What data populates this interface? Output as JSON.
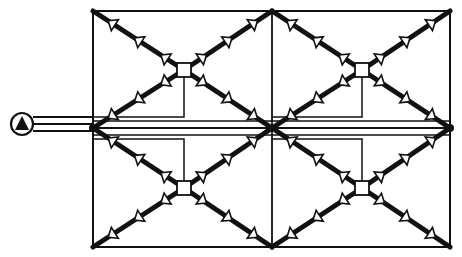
{
  "diagram": {
    "type": "piping-schematic",
    "colors": {
      "line": "#111111",
      "background": "#ffffff",
      "arrow_fill": "#ffffff"
    },
    "frame": {
      "x1": 93,
      "y1": 11,
      "x2": 450,
      "y2": 247,
      "mid_x": 272,
      "mid_y": 128
    },
    "pump": {
      "symbol": "pump-icon",
      "cx": 22,
      "cy": 124,
      "r": 11
    },
    "supply_lines": [
      {
        "y": 117,
        "x_end": 93
      },
      {
        "y": 124,
        "x_end": 93
      },
      {
        "y": 131,
        "x_end": 93
      }
    ],
    "hubs": [
      {
        "id": "hub-top-left",
        "cx": 184,
        "cy": 70
      },
      {
        "id": "hub-top-right",
        "cx": 362,
        "cy": 70
      },
      {
        "id": "hub-bottom-left",
        "cx": 184,
        "cy": 188
      },
      {
        "id": "hub-bottom-right",
        "cx": 362,
        "cy": 188
      }
    ],
    "arrows_per_arm": 3,
    "arrow_direction": "outward-from-hub"
  }
}
